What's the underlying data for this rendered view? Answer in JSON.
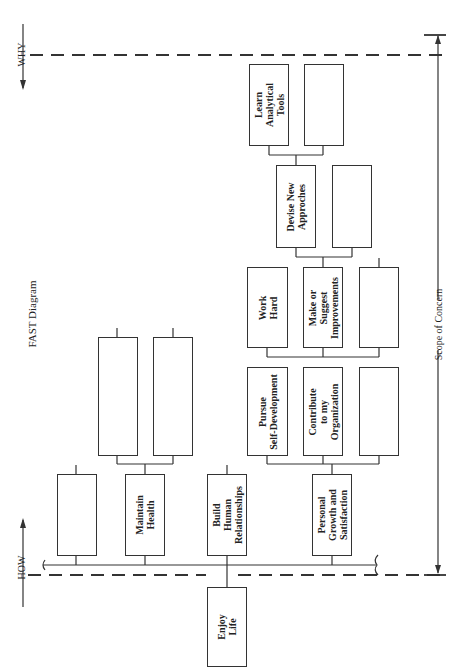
{
  "title": "FAST Diagram",
  "axes": {
    "how_label": "HOW",
    "why_label": "WHY",
    "scope_label": "Scope of Concern"
  },
  "colors": {
    "line": "#333333",
    "background": "#ffffff"
  },
  "nodes": {
    "enjoy_life": "Enjoy\nLife",
    "maintain_health": "Maintain\nHealth",
    "build_relationships": "Build\nHuman\nRelationships",
    "personal_growth": "Personal\nGrowth and\nSatisfaction",
    "pursue_self_development": "Pursue\nSelf-Development",
    "contribute_organization": "Contribute\nto my\nOrganization",
    "work_hard": "Work\nHard",
    "make_suggest_improvements": "Make or\nSuggest\nImprovements",
    "devise_new_approaches": "Devise New\nApproches",
    "learn_analytical_tools": "Learn\nAnalytical\nTools"
  }
}
